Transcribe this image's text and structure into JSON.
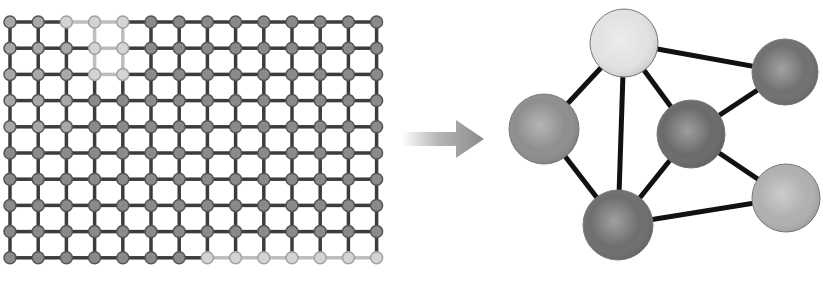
{
  "diagram": {
    "lattice": {
      "cols": 14,
      "rows": 10,
      "origin_x": 10,
      "origin_y": 22,
      "dx": 28.2,
      "dy": 26.2,
      "node_radius": 6,
      "edge_color": "#3c3c3c",
      "edge_highlight_color": "#bdbdbd",
      "node_color": "#8a8a8a",
      "node_light_color": "#a8a8a8",
      "node_highlight_color": "#d4d4d4",
      "highlight_nodes": [
        [
          0,
          2
        ],
        [
          0,
          3
        ],
        [
          0,
          4
        ],
        [
          1,
          3
        ],
        [
          1,
          4
        ],
        [
          2,
          3
        ],
        [
          2,
          4
        ],
        [
          9,
          7
        ],
        [
          9,
          8
        ],
        [
          9,
          9
        ],
        [
          9,
          10
        ],
        [
          9,
          11
        ],
        [
          9,
          12
        ],
        [
          9,
          13
        ]
      ],
      "light_nodes": [
        [
          0,
          0
        ],
        [
          0,
          1
        ],
        [
          1,
          0
        ],
        [
          1,
          1
        ],
        [
          1,
          2
        ],
        [
          2,
          0
        ],
        [
          2,
          1
        ],
        [
          2,
          2
        ],
        [
          3,
          0
        ],
        [
          3,
          1
        ],
        [
          3,
          2
        ],
        [
          4,
          0
        ],
        [
          4,
          1
        ],
        [
          4,
          2
        ]
      ]
    },
    "arrow": {
      "x1": 402,
      "x2": 484,
      "y": 139,
      "color": "#8c8c8c",
      "icon": "arrow-right-icon"
    },
    "network": {
      "nodes": [
        {
          "id": "top",
          "cx": 624,
          "cy": 43,
          "r": 34,
          "color": "#e2e2e2"
        },
        {
          "id": "upper-right",
          "cx": 785,
          "cy": 72,
          "r": 33,
          "color": "#707070"
        },
        {
          "id": "left",
          "cx": 544,
          "cy": 129,
          "r": 35,
          "color": "#8e8e8e"
        },
        {
          "id": "center",
          "cx": 691,
          "cy": 134,
          "r": 34,
          "color": "#6a6a6a"
        },
        {
          "id": "lower-right",
          "cx": 786,
          "cy": 198,
          "r": 34,
          "color": "#b0b0b0"
        },
        {
          "id": "bottom",
          "cx": 618,
          "cy": 225,
          "r": 35,
          "color": "#6e6e6e"
        }
      ],
      "edges": [
        [
          "top",
          "upper-right"
        ],
        [
          "top",
          "left"
        ],
        [
          "top",
          "bottom"
        ],
        [
          "top",
          "center"
        ],
        [
          "center",
          "upper-right"
        ],
        [
          "center",
          "lower-right"
        ],
        [
          "center",
          "bottom"
        ],
        [
          "left",
          "bottom"
        ],
        [
          "bottom",
          "lower-right"
        ]
      ],
      "edge_color": "#111111",
      "edge_width": 5
    }
  }
}
